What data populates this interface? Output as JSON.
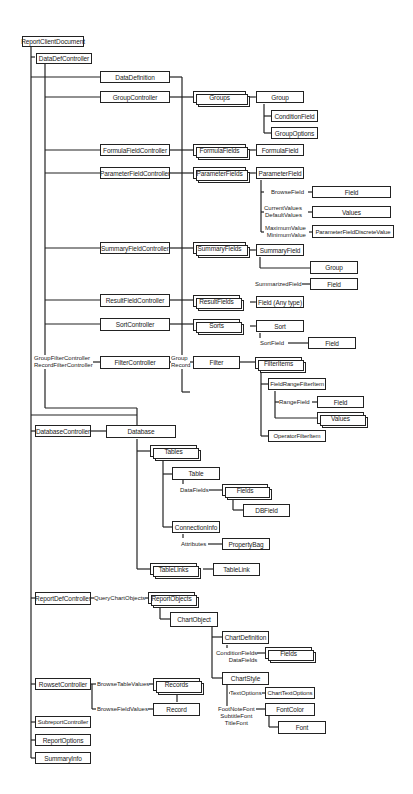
{
  "title_fragment": "...ClientDocument Object Model — Contents",
  "nodes": {
    "ReportClientDocument": "ReportClientDocument",
    "DataDefController": "DataDefController",
    "DataDefinition": "DataDefinition",
    "GroupController": "GroupController",
    "Groups": "Groups",
    "Group": "Group",
    "ConditionField": "ConditionField",
    "GroupOptions": "GroupOptions",
    "FormulaFieldController": "FormulaFieldController",
    "FormulaFields": "FormulaFields",
    "FormulaField": "FormulaField",
    "ParameterFieldController": "ParameterFieldController",
    "ParameterFields": "ParameterFields",
    "ParameterField": "ParameterField",
    "BrowseFieldTarget": "Field",
    "Values": "Values",
    "ParameterFieldDiscreteValue": "ParameterFieldDiscreteValue",
    "SummaryFieldController": "SummaryFieldController",
    "SummaryFields": "SummaryFields",
    "SummaryField": "SummaryField",
    "SummaryGroup": "Group",
    "SummarizedFieldTarget": "Field",
    "ResultFieldController": "ResultFieldController",
    "ResultFields": "ResultFields",
    "FieldAnyType": "Field (Any type)",
    "SortController": "SortController",
    "Sorts": "Sorts",
    "Sort": "Sort",
    "SortFieldTarget": "Field",
    "FilterController": "FilterController",
    "Filter": "Filter",
    "FilterItems": "FilterItems",
    "FieldRangeFilterItem": "FieldRangeFilterItem",
    "RangeFieldTarget": "Field",
    "RangeValues": "Values",
    "OperatorFilterItem": "OperatorFilterItem",
    "DatabaseController": "DatabaseController",
    "Database": "Database",
    "Tables": "Tables",
    "Table": "Table",
    "Fields": "Fields",
    "DBField": "DBField",
    "ConnectionInfo": "ConnectionInfo",
    "PropertyBag": "PropertyBag",
    "TableLinks": "TableLinks",
    "TableLink": "TableLink",
    "ReportDefController": "ReportDefController",
    "ReportObjects": "ReportObjects",
    "ChartObject": "ChartObject",
    "ChartDefinition": "ChartDefinition",
    "ChartFields": "Fields",
    "ChartStyle": "ChartStyle",
    "ChartTextOptions": "ChartTextOptions",
    "FontColor": "FontColor",
    "Font": "Font",
    "RowsetController": "RowsetController",
    "Records": "Records",
    "Record": "Record",
    "SubreportController": "SubreportController",
    "ReportOptions": "ReportOptions",
    "SummaryInfo": "SummaryInfo"
  },
  "edge_labels": {
    "browse_field": "BrowseField",
    "current_values": "CurrentValues",
    "default_values": "DefaultValues",
    "maximum_value": "MaximumValue",
    "minimum_value": "MinimumValue",
    "summarized_field": "SummarizedField",
    "sort_field": "SortField",
    "group_filter_controller": "GroupFilterController",
    "record_filter_controller": "RecordFilterController",
    "group": "Group",
    "record": "Record",
    "range_field": "RangeField",
    "data_fields": "DataFields",
    "attributes": "Attributes",
    "query_chart_objects": "QueryChartObjects",
    "condition_fields": "ConditionFields",
    "chart_data_fields": "DataFields",
    "text_options": "TextOptions",
    "footnote_font": "FootNoteFont",
    "subtitle_font": "SubtitleFont",
    "title_font": "TitleFont",
    "browse_table_values": "BrowseTableValues",
    "browse_field_values": "BrowseFieldValues"
  }
}
